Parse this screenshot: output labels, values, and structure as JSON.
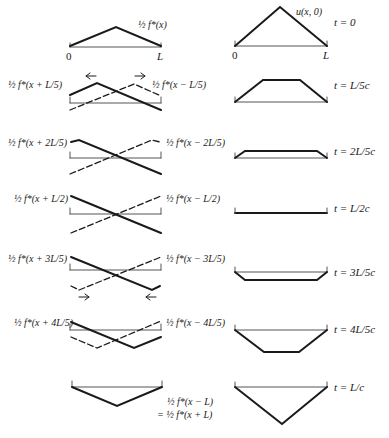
{
  "figure": {
    "left_column": {
      "rows": [
        {
          "left_label": "",
          "right_label": "½ f*(x)",
          "axis_start": "0",
          "axis_end": "L"
        },
        {
          "left_label": "½ f*(x + L/5)",
          "right_label": "½ f*(x − L/5)"
        },
        {
          "left_label": "½ f*(x + 2L/5)",
          "right_label": "½ f*(x − 2L/5)"
        },
        {
          "left_label": "½ f*(x + L/2)",
          "right_label": "½ f*(x − L/2)"
        },
        {
          "left_label": "½ f*(x + 3L/5)",
          "right_label": "½ f*(x − 3L/5)"
        },
        {
          "left_label": "½ f*(x + 4L/5)",
          "right_label": "½ f*(x − 4L/5)"
        },
        {
          "left_label": "",
          "right_label_line1": "½ f*(x − L)",
          "right_label_line2": "= ½ f*(x + L)"
        }
      ]
    },
    "right_column": {
      "curve_label": "u(x, 0)",
      "axis_start": "0",
      "axis_end": "L",
      "times": [
        "t = 0",
        "t = L/5c",
        "t = 2L/5c",
        "t = L/2c",
        "t = 3L/5c",
        "t = 4L/5c",
        "t = L/c"
      ]
    },
    "colors": {
      "ink": "#1a1a1a",
      "axis": "#555555",
      "background": "#ffffff"
    }
  }
}
